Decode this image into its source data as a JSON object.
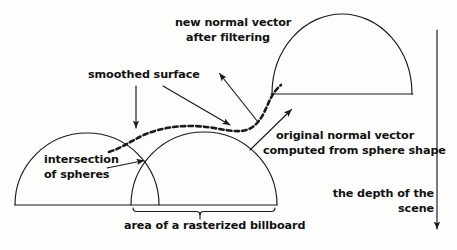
{
  "figure": {
    "width": 457,
    "height": 250,
    "background_color": "#fdfdfc",
    "ink_color": "#1a1a1a"
  },
  "labels": {
    "new_normal_vector": "new normal vector\nafter filtering",
    "smoothed_surface": "smoothed surface",
    "original_normal_vector": "original normal vector\ncomputed from sphere shape",
    "intersection_of_spheres": "intersection\nof spheres",
    "depth_of_scene": "the depth of the\nscene",
    "rasterized_billboard": "area of a rasterized billboard"
  },
  "shapes": {
    "left_sphere": {
      "name": "left sphere dome",
      "cx": 87,
      "cy": 205,
      "rx": 72,
      "ry": 72
    },
    "right_sphere": {
      "name": "right sphere dome",
      "cx": 204,
      "cy": 205,
      "rx": 73,
      "ry": 73
    },
    "far_sphere": {
      "name": "far sphere dome",
      "cx": 342,
      "cy": 94,
      "rx": 70,
      "ry": 80
    },
    "ground_line": {
      "name": "baseline",
      "x1": 15,
      "y1": 205,
      "x2": 277,
      "y2": 205
    },
    "far_baseline": {
      "name": "far dome baseline",
      "x1": 272,
      "y1": 94,
      "x2": 413,
      "y2": 94
    },
    "smoothed_curve": {
      "name": "smoothed surface dashed curve",
      "style": "dashed",
      "from_x": 109,
      "from_y": 146,
      "to_x": 281,
      "to_y": 84
    },
    "billboard_brace": {
      "x_left": 133,
      "x_right": 275,
      "y": 211,
      "tick_y": 219
    },
    "depth_arrow": {
      "x": 437,
      "y_top": 30,
      "y_bottom": 232
    }
  },
  "arrows": [
    {
      "name": "new-normal-vector-arrow",
      "x1": 258,
      "y1": 122,
      "x2": 218,
      "y2": 72
    },
    {
      "name": "smoothed-surface-arrow-left",
      "x1": 136,
      "y1": 86,
      "x2": 136,
      "y2": 131
    },
    {
      "name": "smoothed-surface-arrow-right",
      "x1": 162,
      "y1": 86,
      "x2": 232,
      "y2": 127
    },
    {
      "name": "original-normal-vector-arrow",
      "x1": 250,
      "y1": 150,
      "x2": 293,
      "y2": 108
    },
    {
      "name": "intersection-arrow",
      "x1": 108,
      "y1": 168,
      "x2": 147,
      "y2": 160
    }
  ]
}
